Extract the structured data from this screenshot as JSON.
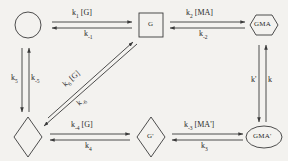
{
  "diagram": {
    "type": "reaction-scheme",
    "stroke_color": "#3a3a3a",
    "background_color": "#f3f2ef",
    "text_color": "#2a2a2a",
    "nodes": [
      {
        "id": "node-circle",
        "shape": "circle",
        "label": "",
        "row": "top",
        "col": 1
      },
      {
        "id": "node-square-g",
        "shape": "square",
        "label": "G",
        "row": "top",
        "col": 2
      },
      {
        "id": "node-hexagon-gma",
        "shape": "hexagon",
        "label": "GMA",
        "row": "top",
        "col": 3
      },
      {
        "id": "node-diamond",
        "shape": "diamond",
        "label": "",
        "row": "bottom",
        "col": 1
      },
      {
        "id": "node-diamond-gprime",
        "shape": "diamond",
        "label": "G'",
        "row": "bottom",
        "col": 2
      },
      {
        "id": "node-ellipse-gmaprime",
        "shape": "ellipse",
        "label": "GMA'",
        "row": "bottom",
        "col": 3
      }
    ],
    "edges": [
      {
        "id": "edge-top-left",
        "from": "node-circle",
        "to": "node-square-g",
        "orientation": "horizontal",
        "forward_label": "k1 [G]",
        "forward_rate": "k",
        "forward_sub": "1",
        "forward_species": "[G]",
        "reverse_label": "k-1",
        "reverse_rate": "k",
        "reverse_sub": "-1",
        "reverse_species": ""
      },
      {
        "id": "edge-top-right",
        "from": "node-square-g",
        "to": "node-hexagon-gma",
        "orientation": "horizontal",
        "forward_label": "k2 [MA]",
        "forward_rate": "k",
        "forward_sub": "2",
        "forward_species": "[MA]",
        "reverse_label": "k-2",
        "reverse_rate": "k",
        "reverse_sub": "-2",
        "reverse_species": ""
      },
      {
        "id": "edge-bottom-left",
        "from": "node-diamond",
        "to": "node-diamond-gprime",
        "orientation": "horizontal",
        "forward_label": "k-4 [G]",
        "forward_rate": "k",
        "forward_sub": "-4",
        "forward_species": "[G]",
        "reverse_label": "k4",
        "reverse_rate": "k",
        "reverse_sub": "4",
        "reverse_species": ""
      },
      {
        "id": "edge-bottom-right",
        "from": "node-diamond-gprime",
        "to": "node-ellipse-gmaprime",
        "orientation": "horizontal",
        "forward_label": "k-3 [MA']",
        "forward_rate": "k",
        "forward_sub": "-3",
        "forward_species": "[MA']",
        "reverse_label": "k3",
        "reverse_rate": "k",
        "reverse_sub": "3",
        "reverse_species": ""
      },
      {
        "id": "edge-left-vertical",
        "from": "node-circle",
        "to": "node-diamond",
        "orientation": "vertical",
        "forward_label": "k5",
        "forward_rate": "k",
        "forward_sub": "5",
        "forward_species": "",
        "reverse_label": "k-5",
        "reverse_rate": "k",
        "reverse_sub": "-5",
        "reverse_species": ""
      },
      {
        "id": "edge-right-vertical",
        "from": "node-hexagon-gma",
        "to": "node-ellipse-gmaprime",
        "orientation": "vertical",
        "forward_label": "k'",
        "forward_rate": "k'",
        "forward_sub": "",
        "forward_species": "",
        "reverse_label": "k",
        "reverse_rate": "k",
        "reverse_sub": "",
        "reverse_species": ""
      },
      {
        "id": "edge-diagonal",
        "from": "node-diamond",
        "to": "node-square-g",
        "orientation": "diagonal",
        "forward_label": "k6 [G]",
        "forward_rate": "k",
        "forward_sub": "6",
        "forward_species": "[G]",
        "reverse_label": "k-6",
        "reverse_rate": "k",
        "reverse_sub": "-6",
        "reverse_species": ""
      }
    ]
  }
}
